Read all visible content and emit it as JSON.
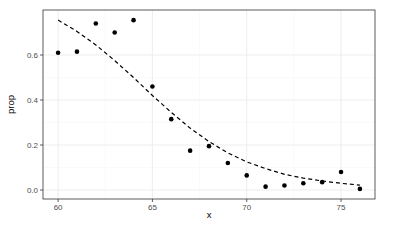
{
  "chart_data": {
    "type": "scatter",
    "title": "",
    "xlabel": "x",
    "ylabel": "prop",
    "xlim": [
      59.2,
      76.8
    ],
    "ylim": [
      -0.04,
      0.8
    ],
    "x_ticks": [
      60,
      65,
      70,
      75
    ],
    "x_tick_labels": [
      "60",
      "65",
      "70",
      "75"
    ],
    "y_ticks": [
      0.0,
      0.2,
      0.4,
      0.6
    ],
    "y_tick_labels": [
      "0.0",
      "0.2",
      "0.4",
      "0.6"
    ],
    "grid": true,
    "legend": null,
    "series": [
      {
        "name": "observed",
        "type": "scatter",
        "x": [
          60,
          61,
          62,
          63,
          64,
          65,
          66,
          67,
          68,
          69,
          70,
          71,
          72,
          73,
          74,
          75,
          76
        ],
        "y": [
          0.61,
          0.615,
          0.74,
          0.7,
          0.755,
          0.46,
          0.315,
          0.175,
          0.195,
          0.12,
          0.065,
          0.015,
          0.02,
          0.03,
          0.035,
          0.08,
          0.005
        ]
      },
      {
        "name": "fitted",
        "type": "line",
        "style": "dashed",
        "x": [
          60,
          61,
          62,
          63,
          64,
          65,
          66,
          67,
          68,
          69,
          70,
          71,
          72,
          73,
          74,
          75,
          76
        ],
        "y": [
          0.755,
          0.705,
          0.645,
          0.575,
          0.5,
          0.42,
          0.345,
          0.275,
          0.215,
          0.165,
          0.125,
          0.095,
          0.07,
          0.053,
          0.04,
          0.03,
          0.022
        ]
      }
    ]
  },
  "colors": {
    "panel_border": "#333333",
    "grid_major": "#ebebeb",
    "grid_minor": "#f5f5f5",
    "points": "#000000",
    "line": "#000000"
  }
}
